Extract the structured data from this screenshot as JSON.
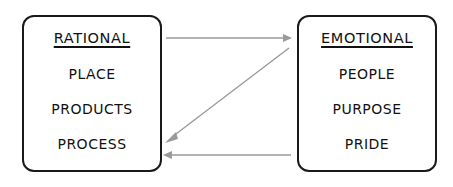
{
  "diagram": {
    "type": "two-box-relationship-diagram",
    "background_color": "#ffffff",
    "box_border_color": "#1a1a1a",
    "arrow_color": "#9a9a9a",
    "text_color": "#111111",
    "boxes": [
      {
        "id": "rational",
        "heading": "RATIONAL",
        "heading_underlined": true,
        "items": [
          "PLACE",
          "PRODUCTS",
          "PROCESS"
        ]
      },
      {
        "id": "emotional",
        "heading": "EMOTIONAL",
        "heading_underlined": true,
        "items": [
          "PEOPLE",
          "PURPOSE",
          "PRIDE"
        ]
      }
    ],
    "connectors": [
      {
        "id": "rational-to-emotional",
        "label": "",
        "direction": "right",
        "style": "straight",
        "from": "rational",
        "to": "emotional"
      },
      {
        "id": "emotional-to-rational-diagonal",
        "label": "",
        "direction": "left",
        "style": "diagonal",
        "from": "emotional",
        "to": "rational"
      },
      {
        "id": "emotional-to-rational-straight",
        "label": "",
        "direction": "left",
        "style": "straight",
        "from": "emotional",
        "to": "rational"
      }
    ]
  }
}
